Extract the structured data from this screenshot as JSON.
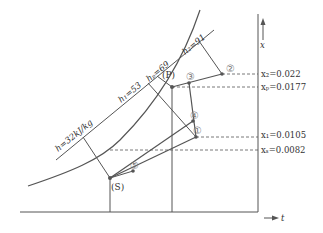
{
  "diagram": {
    "type": "psychrometric-enthalpy-humidity",
    "axes": {
      "x_axis_label": "t",
      "y_axis_label": "x"
    },
    "enthalpy_lines": [
      {
        "id": "hS",
        "label": "h=32kJ/kg"
      },
      {
        "id": "h1",
        "label": "h₁=53"
      },
      {
        "id": "hP",
        "label": "hₚ=69"
      },
      {
        "id": "h2",
        "label": "h₂=91"
      }
    ],
    "humidity_levels": [
      {
        "id": "x2",
        "label": "x₂=0.022"
      },
      {
        "id": "xp",
        "label": "xₚ=0.0177"
      },
      {
        "id": "x1",
        "label": "x₁=0.0105"
      },
      {
        "id": "xs",
        "label": "xₛ=0.0082"
      }
    ],
    "points": [
      {
        "id": "S",
        "label": "(S)"
      },
      {
        "id": "P",
        "label": "(P)"
      },
      {
        "id": "1",
        "label": "①"
      },
      {
        "id": "2",
        "label": "②"
      },
      {
        "id": "3",
        "label": "③"
      },
      {
        "id": "4",
        "label": "④"
      },
      {
        "id": "5",
        "label": "⑤"
      }
    ],
    "colors": {
      "line": "#555555",
      "dashed": "#555555",
      "circle_label": "#777777"
    }
  }
}
